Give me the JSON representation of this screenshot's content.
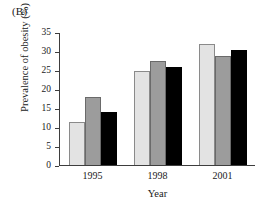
{
  "panel": {
    "label": "(B)"
  },
  "chart_data": {
    "type": "bar",
    "title": "",
    "subtitle": "",
    "xlabel": "Year",
    "ylabel": "Prevalence of obesity (%)",
    "categories": [
      "1995",
      "1998",
      "2001"
    ],
    "series": [
      {
        "name": "series-1",
        "color": "#e3e3e3",
        "values": [
          11.5,
          25.0,
          32.0
        ]
      },
      {
        "name": "series-2",
        "color": "#9c9c9c",
        "values": [
          18.0,
          27.5,
          29.0
        ]
      },
      {
        "name": "series-3",
        "color": "#000000",
        "values": [
          14.0,
          26.0,
          30.5
        ]
      }
    ],
    "ylim": [
      0,
      35
    ],
    "yticks": [
      0,
      5,
      10,
      15,
      20,
      25,
      30,
      35
    ],
    "ytick_labels": [
      "0",
      "5",
      "10",
      "15",
      "20",
      "25",
      "30",
      "35"
    ],
    "grid": false,
    "legend": "none"
  }
}
